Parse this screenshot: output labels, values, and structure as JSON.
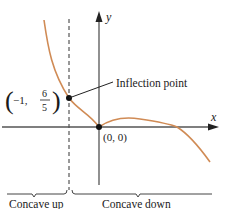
{
  "figure": {
    "axes": {
      "x_label": "x",
      "y_label": "y"
    },
    "colors": {
      "curve": "#d08b55",
      "axis": "#555555",
      "text": "#1a1a1a",
      "point": "#111111"
    },
    "points": {
      "inflection": {
        "coord_prefix": "−1,",
        "frac_num": "6",
        "frac_den": "5",
        "open_paren": "(",
        "close_paren": ")"
      },
      "origin": {
        "label": "(0, 0)"
      }
    },
    "annotations": {
      "inflection_label": "Inflection point"
    },
    "regions": {
      "left_label": "Concave up",
      "right_label": "Concave down"
    }
  }
}
